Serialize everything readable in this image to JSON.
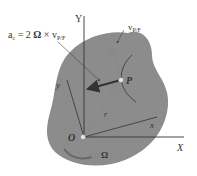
{
  "diagram": {
    "equation": "a_c = 2 Ω × v_P/F",
    "equation_parts": {
      "a": "a",
      "a_sub": "c",
      "eq": " = 2 ",
      "omega": "Ω",
      "cross": " × v",
      "v_sub": "P/F"
    },
    "velocity_label": "v",
    "velocity_sub": "P/F",
    "point_label": "P",
    "origin_label": "O",
    "axis_X": "X",
    "axis_Y": "Y",
    "axis_x": "x",
    "axis_y": "y",
    "position_label": "r",
    "rotation_label": "Ω",
    "colors": {
      "body": "#8c8c8c",
      "arrow": "#7d7d7d",
      "dark_arrow": "#3a3a3a",
      "axis": "#333333"
    }
  }
}
